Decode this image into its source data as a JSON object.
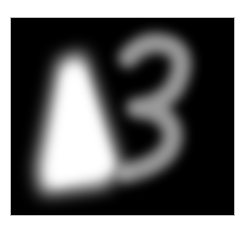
{
  "image": {
    "description": "Blurred white glyphs on black background",
    "glyphs": [
      "triangle-shape",
      "3"
    ],
    "background_color": "#000000",
    "foreground_color": "#ffffff",
    "frame_border_color": "#bdbdbd"
  }
}
